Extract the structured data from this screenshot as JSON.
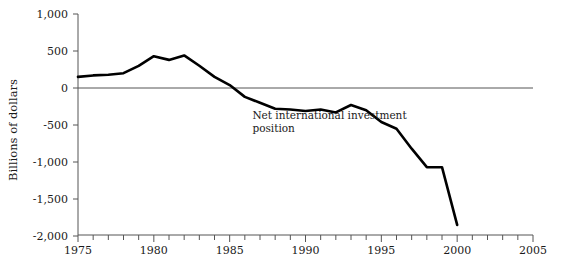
{
  "chart_data": {
    "type": "line",
    "title": "",
    "xlabel": "",
    "ylabel": "Billions of dollars",
    "xlim": [
      1975,
      2005
    ],
    "ylim": [
      -2000,
      1000
    ],
    "grid": false,
    "legend": null,
    "zero_line": true,
    "x_tick_labels": [
      "1975",
      "1980",
      "1985",
      "1990",
      "1995",
      "2000",
      "2005"
    ],
    "x_tick_values": [
      1975,
      1980,
      1985,
      1990,
      1995,
      2000,
      2005
    ],
    "x_minor_step": 1,
    "y_tick_labels": [
      "1,000",
      "500",
      "0",
      "-500",
      "-1,000",
      "-1,500",
      "-2,000"
    ],
    "y_tick_values": [
      1000,
      500,
      0,
      -500,
      -1000,
      -1500,
      -2000
    ],
    "annotations": [
      {
        "name": "series-label",
        "lines": [
          "Net international investment",
          "position"
        ],
        "x": 1986.5,
        "y": -420
      }
    ],
    "series": [
      {
        "name": "Net international investment position",
        "color": "#000000",
        "x": [
          1975,
          1976,
          1977,
          1978,
          1979,
          1980,
          1981,
          1982,
          1983,
          1984,
          1985,
          1986,
          1987,
          1988,
          1989,
          1990,
          1991,
          1992,
          1993,
          1994,
          1995,
          1996,
          1997,
          1998,
          1999,
          2000
        ],
        "values": [
          150,
          170,
          180,
          200,
          300,
          430,
          380,
          440,
          300,
          150,
          40,
          -120,
          -200,
          -280,
          -290,
          -310,
          -290,
          -330,
          -230,
          -300,
          -460,
          -550,
          -820,
          -1070,
          -1070,
          -1850
        ]
      }
    ]
  },
  "axis_label": {
    "y": "Billions of dollars"
  }
}
